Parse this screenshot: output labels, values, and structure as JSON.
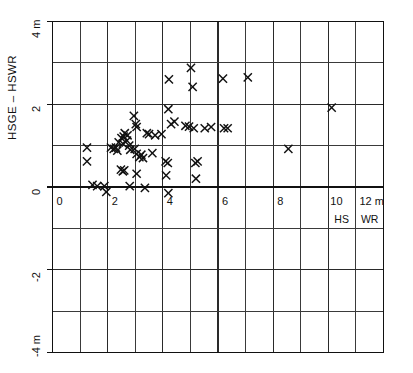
{
  "chart_data": {
    "type": "scatter",
    "title": "",
    "subtitle": "",
    "xlabel": "",
    "ylabel": "HSGE – HSWR",
    "x_unit": "m",
    "y_unit": "m",
    "xlim": [
      0,
      12
    ],
    "ylim": [
      -4,
      4
    ],
    "grid": true,
    "x_major_ticks": [
      0,
      2,
      4,
      6,
      8,
      10,
      12
    ],
    "x_tick_labels": [
      "0",
      "2",
      "4",
      "6",
      "8",
      "10",
      "12 m"
    ],
    "x_minor_step": 1,
    "y_major_ticks": [
      4,
      2,
      0,
      -2,
      -4
    ],
    "y_tick_labels": [
      "4 m",
      "2",
      "0",
      "-2",
      "-4 m"
    ],
    "y_minor_step": 1,
    "legend": null,
    "legend_position": "none",
    "marker_symbol": "x",
    "marker_color": "#111111",
    "annotations": [
      {
        "text": "HS",
        "x": 10.5,
        "y": -0.62
      },
      {
        "text": "WR",
        "x": 11.5,
        "y": -0.62
      }
    ],
    "points": [
      {
        "x": 1.25,
        "y": 0.95
      },
      {
        "x": 1.25,
        "y": 0.62
      },
      {
        "x": 1.45,
        "y": 0.05
      },
      {
        "x": 1.62,
        "y": 0.02
      },
      {
        "x": 1.95,
        "y": -0.12
      },
      {
        "x": 1.88,
        "y": 0.02
      },
      {
        "x": 2.12,
        "y": 0.95
      },
      {
        "x": 2.22,
        "y": 0.92
      },
      {
        "x": 2.35,
        "y": 0.88
      },
      {
        "x": 2.4,
        "y": 1.08
      },
      {
        "x": 2.5,
        "y": 1.18
      },
      {
        "x": 2.55,
        "y": 1.05
      },
      {
        "x": 2.58,
        "y": 1.22
      },
      {
        "x": 2.62,
        "y": 1.3
      },
      {
        "x": 2.7,
        "y": 1.12
      },
      {
        "x": 2.72,
        "y": 1.25
      },
      {
        "x": 2.78,
        "y": 1.0
      },
      {
        "x": 2.82,
        "y": 0.9
      },
      {
        "x": 2.48,
        "y": 0.42
      },
      {
        "x": 2.55,
        "y": 0.38
      },
      {
        "x": 2.6,
        "y": 0.4
      },
      {
        "x": 2.3,
        "y": 0.95
      },
      {
        "x": 2.95,
        "y": 1.72
      },
      {
        "x": 3.02,
        "y": 1.52
      },
      {
        "x": 3.05,
        "y": 1.45
      },
      {
        "x": 2.98,
        "y": 0.92
      },
      {
        "x": 3.05,
        "y": 0.8
      },
      {
        "x": 3.15,
        "y": 0.72
      },
      {
        "x": 3.22,
        "y": 0.78
      },
      {
        "x": 3.28,
        "y": 0.7
      },
      {
        "x": 3.05,
        "y": 0.32
      },
      {
        "x": 2.8,
        "y": 0.02
      },
      {
        "x": 3.35,
        "y": -0.02
      },
      {
        "x": 3.42,
        "y": 1.3
      },
      {
        "x": 3.5,
        "y": 1.28
      },
      {
        "x": 3.62,
        "y": 0.82
      },
      {
        "x": 3.72,
        "y": 1.25
      },
      {
        "x": 3.95,
        "y": 1.28
      },
      {
        "x": 4.22,
        "y": 2.6
      },
      {
        "x": 4.2,
        "y": 1.88
      },
      {
        "x": 4.3,
        "y": 1.52
      },
      {
        "x": 4.42,
        "y": 1.58
      },
      {
        "x": 4.1,
        "y": 0.62
      },
      {
        "x": 4.18,
        "y": 0.58
      },
      {
        "x": 4.12,
        "y": 0.28
      },
      {
        "x": 4.2,
        "y": -0.15
      },
      {
        "x": 4.82,
        "y": 1.48
      },
      {
        "x": 4.95,
        "y": 1.46
      },
      {
        "x": 5.02,
        "y": 2.88
      },
      {
        "x": 5.08,
        "y": 2.42
      },
      {
        "x": 5.12,
        "y": 1.42
      },
      {
        "x": 5.18,
        "y": 0.58
      },
      {
        "x": 5.26,
        "y": 0.62
      },
      {
        "x": 5.2,
        "y": 0.2
      },
      {
        "x": 5.52,
        "y": 1.42
      },
      {
        "x": 5.75,
        "y": 1.45
      },
      {
        "x": 6.18,
        "y": 2.62
      },
      {
        "x": 6.22,
        "y": 1.42
      },
      {
        "x": 6.35,
        "y": 1.42
      },
      {
        "x": 7.08,
        "y": 2.65
      },
      {
        "x": 8.55,
        "y": 0.92
      },
      {
        "x": 10.12,
        "y": 1.92
      }
    ]
  },
  "axis_labels": {
    "y_title": "HSGE – HSWR",
    "y_top": "4 m",
    "y_2": "2",
    "y_0": "0",
    "y_neg2": "-2",
    "y_bottom": "-4 m",
    "x_0": "0",
    "x_2": "2",
    "x_4": "4",
    "x_6": "6",
    "x_8": "8",
    "x_10": "10",
    "x_12": "12 m",
    "hs": "HS",
    "wr": "WR"
  }
}
